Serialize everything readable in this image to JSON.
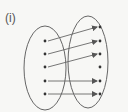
{
  "figure": {
    "label": "(i)",
    "colors": {
      "stroke": "#666666",
      "dot": "#333333",
      "background": "#f7f7f5"
    },
    "domain_set": {
      "ellipse": {
        "cx": 45,
        "cy": 68,
        "rx": 21,
        "ry": 42
      },
      "points": [
        {
          "id": "L1",
          "x": 45,
          "y": 41
        },
        {
          "id": "L2",
          "x": 45,
          "y": 54
        },
        {
          "id": "L3",
          "x": 45,
          "y": 67
        },
        {
          "id": "L4",
          "x": 45,
          "y": 81
        },
        {
          "id": "L5",
          "x": 45,
          "y": 94
        }
      ]
    },
    "codomain_set": {
      "ellipse": {
        "cx": 88,
        "cy": 62,
        "rx": 20,
        "ry": 46
      },
      "points": [
        {
          "id": "R1",
          "x": 100,
          "y": 27
        },
        {
          "id": "R2",
          "x": 100,
          "y": 41
        },
        {
          "id": "R3",
          "x": 100,
          "y": 54
        },
        {
          "id": "R4",
          "x": 100,
          "y": 67
        },
        {
          "id": "R5",
          "x": 100,
          "y": 81
        },
        {
          "id": "R6",
          "x": 100,
          "y": 94
        }
      ]
    },
    "mappings": [
      {
        "from": "L1",
        "to": "R1"
      },
      {
        "from": "L2",
        "to": "R2"
      },
      {
        "from": "L3",
        "to": "R3"
      },
      {
        "from": "L4",
        "to": "R5"
      },
      {
        "from": "L5",
        "to": "R6"
      }
    ]
  }
}
